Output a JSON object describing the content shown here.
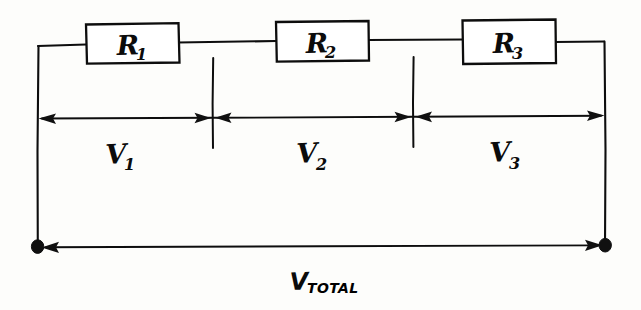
{
  "diagram": {
    "type": "hand-drawn-schematic",
    "ink_color": "#0d0d0d",
    "background_color": "#fdfdfb",
    "resistors": [
      {
        "id": "r1",
        "symbol": "R",
        "subscript": "1",
        "label": "R1"
      },
      {
        "id": "r2",
        "symbol": "R",
        "subscript": "2",
        "label": "R2"
      },
      {
        "id": "r3",
        "symbol": "R",
        "subscript": "3",
        "label": "R3"
      }
    ],
    "voltage_drops": [
      {
        "id": "v1",
        "symbol": "V",
        "subscript": "1",
        "label": "V1"
      },
      {
        "id": "v2",
        "symbol": "V",
        "subscript": "2",
        "label": "V2"
      },
      {
        "id": "v3",
        "symbol": "V",
        "subscript": "3",
        "label": "V3"
      }
    ],
    "total_voltage": {
      "id": "vtotal",
      "symbol": "V",
      "subscript": "TOTAL",
      "label": "VTOTAL"
    },
    "terminals": [
      {
        "id": "terminal-left",
        "name": "left-terminal-node"
      },
      {
        "id": "terminal-right",
        "name": "right-terminal-node"
      }
    ],
    "dimension_ticks": [
      {
        "id": "tick-1",
        "name": "divider-tick-between-v1-v2"
      },
      {
        "id": "tick-2",
        "name": "divider-tick-between-v2-v3"
      }
    ]
  }
}
